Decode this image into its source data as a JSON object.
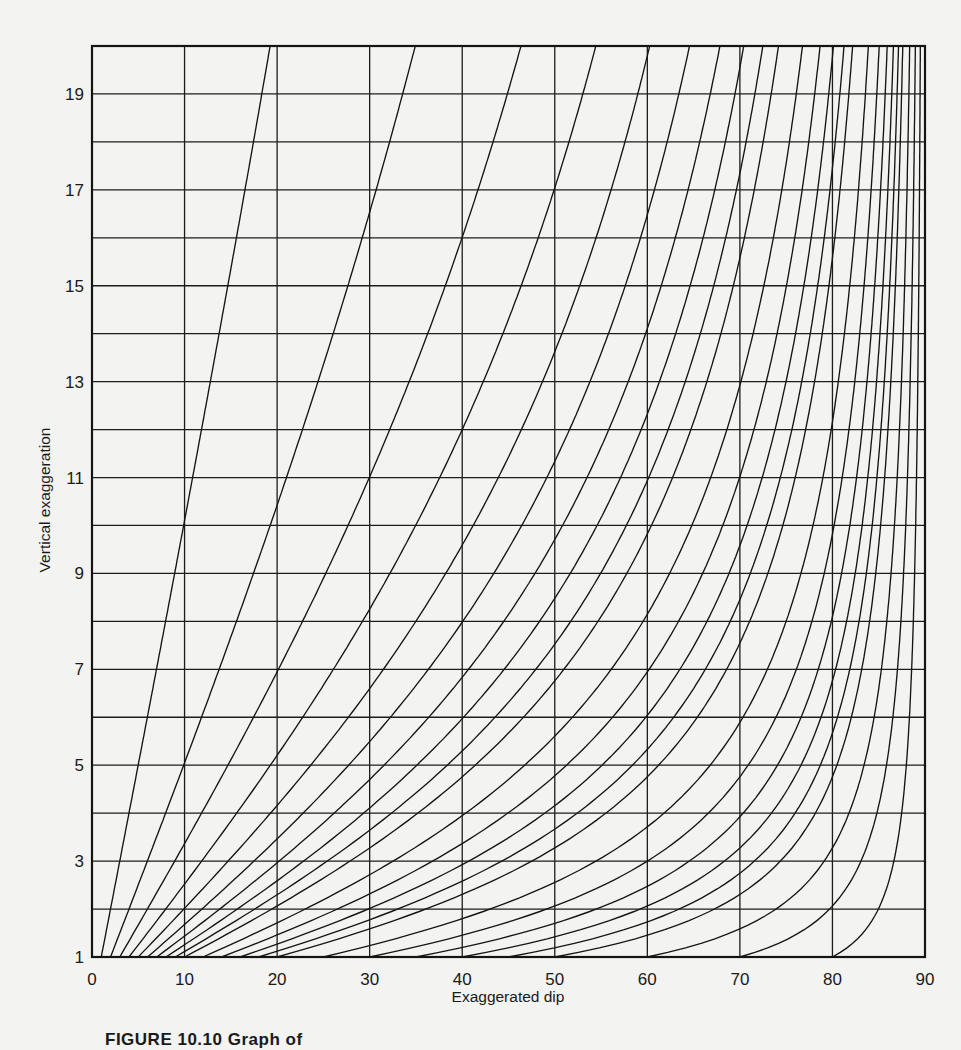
{
  "chart_data": {
    "type": "line",
    "title": "",
    "xlabel": "Exaggerated dip",
    "ylabel": "Vertical exaggeration",
    "xlim": [
      0,
      90
    ],
    "ylim": [
      1,
      20
    ],
    "x_ticks": [
      0,
      10,
      20,
      30,
      40,
      50,
      60,
      70,
      80,
      90
    ],
    "y_ticks": [
      1,
      3,
      5,
      7,
      9,
      11,
      13,
      15,
      17,
      19
    ],
    "grid": {
      "x_step": 10,
      "y_step": 1,
      "visible": true
    },
    "legend": null,
    "relation": "tan(exaggerated dip) = vertical exaggeration × tan(true dip)",
    "series_true_dips_deg": [
      1,
      2,
      3,
      4,
      5,
      6,
      7,
      8,
      9,
      10,
      12,
      14,
      16,
      18,
      20,
      25,
      30,
      35,
      40,
      45,
      50,
      60,
      70,
      80
    ],
    "sample_points": [
      {
        "true_dip": 1,
        "points": [
          [
            1,
            1
          ],
          [
            5,
            5.0
          ],
          [
            10,
            9.9
          ],
          [
            20,
            19.2
          ]
        ]
      },
      {
        "true_dip": 2,
        "points": [
          [
            1,
            2
          ],
          [
            5,
            9.9
          ],
          [
            10,
            19.2
          ],
          [
            20,
            34.9
          ]
        ]
      },
      {
        "true_dip": 5,
        "points": [
          [
            1,
            5
          ],
          [
            5,
            23.6
          ],
          [
            10,
            41.2
          ],
          [
            20,
            60.3
          ]
        ]
      },
      {
        "true_dip": 10,
        "points": [
          [
            1,
            10
          ],
          [
            5,
            41.4
          ],
          [
            10,
            60.4
          ],
          [
            20,
            74.2
          ]
        ]
      },
      {
        "true_dip": 20,
        "points": [
          [
            1,
            20
          ],
          [
            5,
            61.2
          ],
          [
            10,
            74.6
          ],
          [
            20,
            82.2
          ]
        ]
      },
      {
        "true_dip": 30,
        "points": [
          [
            1,
            30
          ],
          [
            5,
            70.9
          ],
          [
            10,
            80.2
          ],
          [
            20,
            85.0
          ]
        ]
      },
      {
        "true_dip": 45,
        "points": [
          [
            1,
            45
          ],
          [
            5,
            78.7
          ],
          [
            10,
            84.3
          ],
          [
            20,
            87.1
          ]
        ]
      },
      {
        "true_dip": 60,
        "points": [
          [
            1,
            60
          ],
          [
            5,
            83.4
          ],
          [
            10,
            86.7
          ],
          [
            20,
            88.3
          ]
        ]
      },
      {
        "true_dip": 80,
        "points": [
          [
            1,
            80
          ],
          [
            5,
            88.0
          ],
          [
            10,
            89.0
          ],
          [
            20,
            89.5
          ]
        ]
      }
    ]
  },
  "axes": {
    "x_label": "Exaggerated dip",
    "y_label": "Vertical exaggeration"
  },
  "caption": "FIGURE 10.10  Graph of"
}
